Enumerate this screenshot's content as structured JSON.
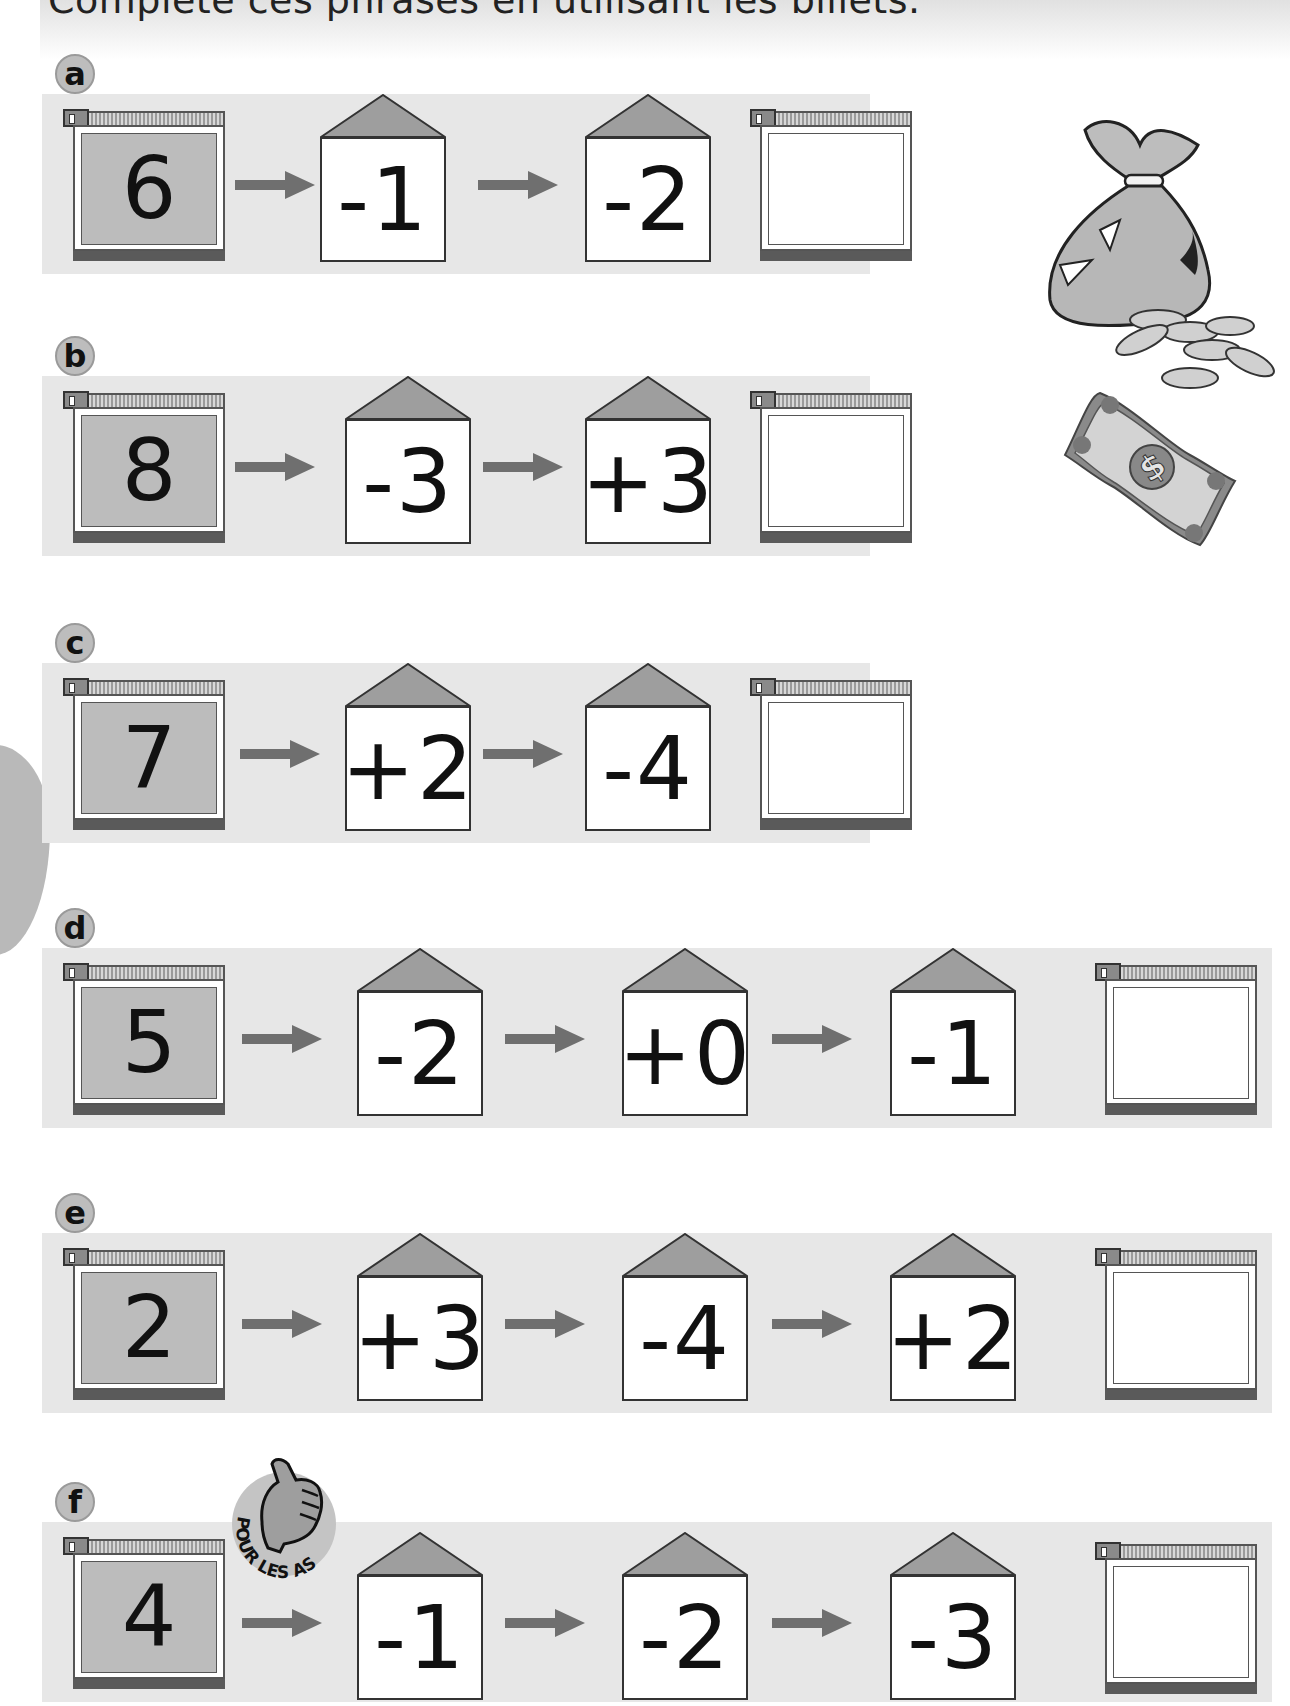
{
  "instruction": "Complète ces phrases en utilisant les billets.",
  "colors": {
    "band": "#e7e7e7",
    "wallet_fill": "#bcbcbc",
    "roof": "#9e9e9e",
    "arrow": "#6f6f6f",
    "letter_badge": "#bdbdbd"
  },
  "illustrations": {
    "money_bag": "money-bag-with-coins",
    "banknote": "dollar-banknote"
  },
  "badge": {
    "text": "POUR LES AS",
    "icon": "thumbs-up"
  },
  "exercises": [
    {
      "letter": "a",
      "start": "6",
      "steps": [
        "-1",
        "-2"
      ],
      "answer": ""
    },
    {
      "letter": "b",
      "start": "8",
      "steps": [
        "-3",
        "+3"
      ],
      "answer": ""
    },
    {
      "letter": "c",
      "start": "7",
      "steps": [
        "+2",
        "-4"
      ],
      "answer": ""
    },
    {
      "letter": "d",
      "start": "5",
      "steps": [
        "-2",
        "+0",
        "-1"
      ],
      "answer": ""
    },
    {
      "letter": "e",
      "start": "2",
      "steps": [
        "+3",
        "-4",
        "+2"
      ],
      "answer": ""
    },
    {
      "letter": "f",
      "start": "4",
      "steps": [
        "-1",
        "-2",
        "-3"
      ],
      "answer": ""
    }
  ]
}
